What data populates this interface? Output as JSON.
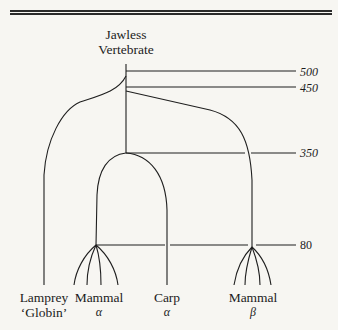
{
  "figure": {
    "root_label_line1": "Jawless",
    "root_label_line2": "Vertebrate",
    "time_scale": {
      "unit_note": "millions of years ago",
      "ticks": [
        "500",
        "450",
        "350",
        "80"
      ]
    },
    "leaves": [
      {
        "line1": "Lamprey",
        "line2": "‘Globin’"
      },
      {
        "line1": "Mammal",
        "line2": "α"
      },
      {
        "line1": "Carp",
        "line2": "α"
      },
      {
        "line1": "Mammal",
        "line2": "β"
      }
    ],
    "nodes": [
      {
        "name": "vertebrate-origin",
        "time": 500
      },
      {
        "name": "alpha-beta-duplication",
        "time": 450
      },
      {
        "name": "fish-mammal-split",
        "time": 350
      },
      {
        "name": "mammal-radiation",
        "time": 80
      }
    ]
  }
}
